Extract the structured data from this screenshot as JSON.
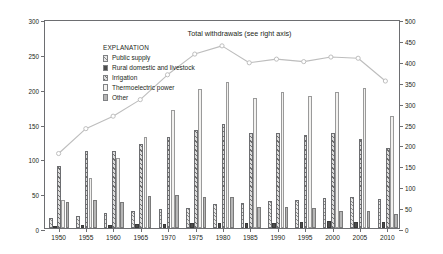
{
  "chart_data": {
    "type": "bar",
    "title": "",
    "subtitle": "",
    "categories": [
      "1950",
      "1955",
      "1960",
      "1965",
      "1970",
      "1975",
      "1980",
      "1985",
      "1990",
      "1995",
      "2000",
      "2005",
      "2010"
    ],
    "xlabel": "",
    "ylabel": "Withdrawals, in billion gallons per day",
    "ylabel_right": "Total withdrawals, in billion gallons per day",
    "ylim": [
      0,
      300
    ],
    "ylim_right": [
      0,
      500
    ],
    "ytick_step": 50,
    "yticks": [
      0,
      50,
      100,
      150,
      200,
      250,
      300
    ],
    "yticks_right": [
      0,
      50,
      100,
      150,
      200,
      250,
      300,
      350,
      400,
      450,
      500
    ],
    "grid": false,
    "legend_position": "upper-left",
    "legend_title": "EXPLANATION",
    "series": [
      {
        "name": "Public supply",
        "axis": "left",
        "style": "hatch-fine",
        "values": [
          14,
          17,
          21,
          24,
          27,
          29,
          34,
          36.5,
          38.5,
          40,
          43,
          44,
          42
        ]
      },
      {
        "name": "Rural domestic and livestock",
        "axis": "left",
        "style": "solid-dark",
        "values": [
          3.6,
          4.2,
          4.6,
          5.1,
          5.8,
          6.5,
          7.0,
          7.2,
          7.9,
          8.9,
          9.4,
          9.0,
          8.5
        ]
      },
      {
        "name": "Irrigation",
        "axis": "left",
        "style": "hatch-coarse",
        "values": [
          89,
          110,
          110,
          120,
          130,
          140,
          150,
          137,
          137,
          134,
          137,
          128,
          115
        ]
      },
      {
        "name": "Thermoelectric power",
        "axis": "left",
        "style": "light",
        "values": [
          40,
          72,
          100,
          130,
          170,
          200,
          210,
          187,
          195,
          190,
          195,
          201,
          161
        ]
      },
      {
        "name": "Other",
        "axis": "left",
        "style": "gray",
        "values": [
          37,
          40,
          38,
          46,
          47,
          45,
          45,
          30,
          30,
          29,
          25,
          25,
          20
        ]
      }
    ],
    "line_series": {
      "name": "Total withdrawals (see right axis)",
      "axis": "right",
      "values": [
        180,
        240,
        270,
        310,
        370,
        420,
        440,
        399,
        408,
        402,
        413,
        410,
        355
      ]
    },
    "annotations": [
      {
        "text": "Total withdrawals (see right axis)"
      }
    ]
  },
  "legend": {
    "title": "EXPLANATION",
    "items": [
      {
        "label": "Public supply",
        "swatch": "hatch-fine"
      },
      {
        "label": "Rural domestic and livestock",
        "swatch": "solid-dark"
      },
      {
        "label": "Irrigation",
        "swatch": "hatch-coarse"
      },
      {
        "label": "Thermoelectric power",
        "swatch": "light"
      },
      {
        "label": "Other",
        "swatch": "gray"
      }
    ]
  },
  "axes": {
    "left_title": "Withdrawals, in billion gallons per day",
    "right_title": "Total withdrawals, in billion gallons per day"
  },
  "colors": {
    "axis": "#6d6e71",
    "line": "#bdbdbd",
    "text": "#231f20"
  }
}
